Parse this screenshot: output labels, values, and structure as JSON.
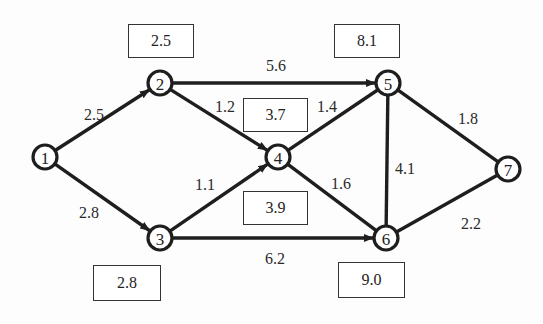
{
  "nodes": [
    {
      "id": "1",
      "x": 45,
      "y": 157
    },
    {
      "id": "2",
      "x": 160,
      "y": 83
    },
    {
      "id": "3",
      "x": 160,
      "y": 238
    },
    {
      "id": "4",
      "x": 278,
      "y": 157
    },
    {
      "id": "5",
      "x": 388,
      "y": 83
    },
    {
      "id": "6",
      "x": 386,
      "y": 238
    },
    {
      "id": "7",
      "x": 508,
      "y": 169
    }
  ],
  "edges": [
    {
      "from": "1",
      "to": "2",
      "weight": "2.5",
      "arrow": true,
      "lx": 94,
      "ly": 114
    },
    {
      "from": "1",
      "to": "3",
      "weight": "2.8",
      "arrow": true,
      "lx": 89,
      "ly": 212
    },
    {
      "from": "2",
      "to": "5",
      "weight": "5.6",
      "arrow": true,
      "lx": 276,
      "ly": 65
    },
    {
      "from": "2",
      "to": "4",
      "weight": "1.2",
      "arrow": true,
      "lx": 225,
      "ly": 106
    },
    {
      "from": "3",
      "to": "4",
      "weight": "1.1",
      "arrow": true,
      "lx": 205,
      "ly": 184
    },
    {
      "from": "3",
      "to": "6",
      "weight": "6.2",
      "arrow": true,
      "lx": 275,
      "ly": 258
    },
    {
      "from": "4",
      "to": "5",
      "weight": "1.4",
      "arrow": false,
      "lx": 327,
      "ly": 106
    },
    {
      "from": "4",
      "to": "6",
      "weight": "1.6",
      "arrow": false,
      "lx": 341,
      "ly": 183
    },
    {
      "from": "5",
      "to": "6",
      "weight": "4.1",
      "arrow": false,
      "lx": 405,
      "ly": 168
    },
    {
      "from": "5",
      "to": "7",
      "weight": "1.8",
      "arrow": false,
      "lx": 468,
      "ly": 118
    },
    {
      "from": "6",
      "to": "7",
      "weight": "2.2",
      "arrow": false,
      "lx": 471,
      "ly": 223
    }
  ],
  "boxes": [
    {
      "value": "2.5",
      "x": 128,
      "y": 24,
      "w": 66,
      "h": 34
    },
    {
      "value": "8.1",
      "x": 334,
      "y": 24,
      "w": 66,
      "h": 34
    },
    {
      "value": "3.7",
      "x": 243,
      "y": 98,
      "w": 65,
      "h": 34
    },
    {
      "value": "3.9",
      "x": 243,
      "y": 191,
      "w": 65,
      "h": 34
    },
    {
      "value": "2.8",
      "x": 93,
      "y": 265,
      "w": 68,
      "h": 36
    },
    {
      "value": "9.0",
      "x": 338,
      "y": 262,
      "w": 67,
      "h": 36
    }
  ]
}
